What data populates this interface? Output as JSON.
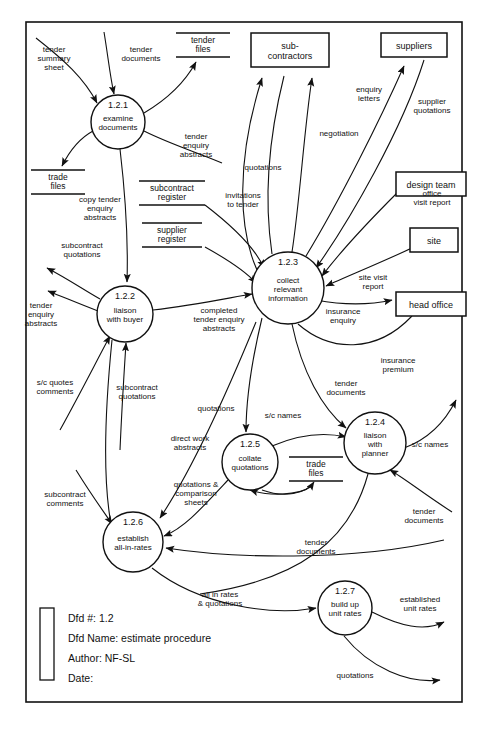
{
  "diagram": {
    "kind": "data-flow-diagram",
    "frame": {
      "x": 26,
      "y": 22,
      "width": 436,
      "height": 680
    }
  },
  "processes": [
    {
      "id": "1.2.1",
      "name_lines": [
        "examine",
        "documents"
      ],
      "cx": 118,
      "cy": 122,
      "r": 27
    },
    {
      "id": "1.2.2",
      "name_lines": [
        "liaison",
        "with buyer"
      ],
      "cx": 125,
      "cy": 314,
      "r": 28
    },
    {
      "id": "1.2.3",
      "name_lines": [
        "collect",
        "relevant",
        "information"
      ],
      "cx": 288,
      "cy": 288,
      "r": 36
    },
    {
      "id": "1.2.4",
      "name_lines": [
        "liaison",
        "with",
        "planner"
      ],
      "cx": 375,
      "cy": 443,
      "r": 31
    },
    {
      "id": "1.2.5",
      "name_lines": [
        "collate",
        "quotations"
      ],
      "cx": 250,
      "cy": 462,
      "r": 28
    },
    {
      "id": "1.2.6",
      "name_lines": [
        "establish",
        "all-in-rates"
      ],
      "cx": 133,
      "cy": 542,
      "r": 30
    },
    {
      "id": "1.2.7",
      "name_lines": [
        "build up",
        "unit rates"
      ],
      "cx": 345,
      "cy": 608,
      "r": 27
    }
  ],
  "entities": [
    {
      "label_lines": [
        "sub-",
        "contractors"
      ],
      "x": 251,
      "y": 33,
      "width": 78,
      "height": 34
    },
    {
      "label_lines": [
        "suppliers"
      ],
      "x": 381,
      "y": 33,
      "width": 66,
      "height": 24
    },
    {
      "label_lines": [
        "design team"
      ],
      "x": 396,
      "y": 172,
      "width": 70,
      "height": 24
    },
    {
      "label_lines": [
        "site"
      ],
      "x": 410,
      "y": 228,
      "width": 48,
      "height": 24
    },
    {
      "label_lines": [
        "head office"
      ],
      "x": 396,
      "y": 292,
      "width": 70,
      "height": 24
    }
  ],
  "stores": [
    {
      "label_lines": [
        "tender",
        "files"
      ],
      "cx": 203,
      "cy": 44,
      "width": 54
    },
    {
      "label_lines": [
        "trade",
        "files"
      ],
      "cx": 58,
      "cy": 181,
      "width": 54
    },
    {
      "label_lines": [
        "subcontract",
        "register"
      ],
      "cx": 172,
      "cy": 192,
      "width": 66
    },
    {
      "label_lines": [
        "supplier",
        "register"
      ],
      "cx": 172,
      "cy": 234,
      "width": 60
    },
    {
      "label_lines": [
        "trade",
        "files"
      ],
      "cx": 316,
      "cy": 468,
      "width": 54
    }
  ],
  "flow_labels": [
    {
      "text_lines": [
        "tender",
        "summary",
        "sheet"
      ],
      "x": 54,
      "y": 52
    },
    {
      "text_lines": [
        "tender",
        "documents"
      ],
      "x": 141,
      "y": 52
    },
    {
      "text_lines": [
        "tender",
        "enquiry",
        "abstracts"
      ],
      "x": 196,
      "y": 139
    },
    {
      "text_lines": [
        "copy tender",
        "enquiry",
        "abstracts"
      ],
      "x": 100,
      "y": 202
    },
    {
      "text_lines": [
        "subcontract",
        "quotations"
      ],
      "x": 82,
      "y": 248
    },
    {
      "text_lines": [
        "tender",
        "enquiry",
        "abstracts"
      ],
      "x": 41,
      "y": 308
    },
    {
      "text_lines": [
        "s/c quotes",
        "comments"
      ],
      "x": 55,
      "y": 385
    },
    {
      "text_lines": [
        "subcontract",
        "quotations"
      ],
      "x": 137,
      "y": 390
    },
    {
      "text_lines": [
        "completed",
        "tender enquiry",
        "abstracts"
      ],
      "x": 219,
      "y": 313
    },
    {
      "text_lines": [
        "invitations",
        "to tender"
      ],
      "x": 243,
      "y": 198
    },
    {
      "text_lines": [
        "quotations"
      ],
      "x": 263,
      "y": 170
    },
    {
      "text_lines": [
        "negotiation"
      ],
      "x": 339,
      "y": 136
    },
    {
      "text_lines": [
        "enquiry",
        "letters"
      ],
      "x": 369,
      "y": 92
    },
    {
      "text_lines": [
        "supplier",
        "quotations"
      ],
      "x": 432,
      "y": 104
    },
    {
      "text_lines": [
        "office",
        "visit report",
        ""
      ],
      "x": 432,
      "y": 196
    },
    {
      "text_lines": [
        "site visit",
        "report"
      ],
      "x": 373,
      "y": 280
    },
    {
      "text_lines": [
        "insurance",
        "enquiry",
        ""
      ],
      "x": 343,
      "y": 314
    },
    {
      "text_lines": [
        "insurance",
        "premium"
      ],
      "x": 398,
      "y": 363
    },
    {
      "text_lines": [
        "tender",
        "documents"
      ],
      "x": 346,
      "y": 386
    },
    {
      "text_lines": [
        "quotations"
      ],
      "x": 216,
      "y": 411
    },
    {
      "text_lines": [
        "s/c names"
      ],
      "x": 283,
      "y": 418
    },
    {
      "text_lines": [
        "s/c names"
      ],
      "x": 430,
      "y": 447
    },
    {
      "text_lines": [
        "direct work",
        "abstracts"
      ],
      "x": 190,
      "y": 441
    },
    {
      "text_lines": [
        "quotations &",
        "comparison",
        "sheets"
      ],
      "x": 196,
      "y": 487
    },
    {
      "text_lines": [
        "subcontract",
        "comments"
      ],
      "x": 65,
      "y": 497
    },
    {
      "text_lines": [
        "tender",
        "documents"
      ],
      "x": 316,
      "y": 545
    },
    {
      "text_lines": [
        "tender",
        "documents"
      ],
      "x": 424,
      "y": 514
    },
    {
      "text_lines": [
        "all in rates",
        "& quotations"
      ],
      "x": 220,
      "y": 597
    },
    {
      "text_lines": [
        "established",
        "unit rates"
      ],
      "x": 420,
      "y": 602
    },
    {
      "text_lines": [
        "quotations"
      ],
      "x": 355,
      "y": 678
    }
  ],
  "legend": {
    "bar": {
      "x": 40,
      "y": 608,
      "width": 14,
      "height": 72
    },
    "lines": [
      "Dfd #: 1.2",
      "Dfd Name: estimate procedure",
      "Author: NF-SL",
      "Date:"
    ]
  },
  "colors": {
    "ink": "#111111",
    "paper": "#ffffff"
  }
}
